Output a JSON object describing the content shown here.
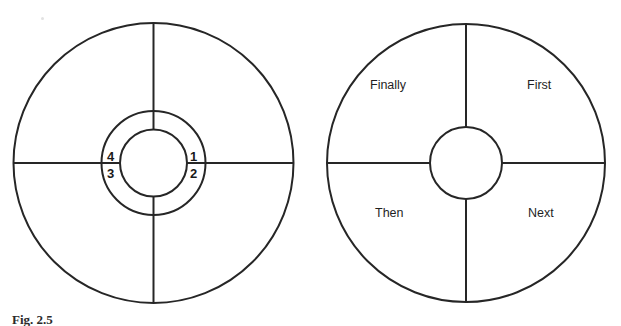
{
  "figure": {
    "caption": "Fig. 2.5",
    "background_color": "#ffffff",
    "stroke_color": "#262626"
  },
  "left_diagram": {
    "name": "numbered-quadrant-wheel",
    "segment_labels": [
      {
        "id": "1",
        "text": "1",
        "quadrant": "upper-right"
      },
      {
        "id": "2",
        "text": "2",
        "quadrant": "lower-right"
      },
      {
        "id": "3",
        "text": "3",
        "quadrant": "lower-left"
      },
      {
        "id": "4",
        "text": "4",
        "quadrant": "upper-left"
      }
    ]
  },
  "right_diagram": {
    "name": "sequence-quadrant-wheel",
    "segment_labels": [
      {
        "id": "first",
        "text": "First",
        "quadrant": "upper-right"
      },
      {
        "id": "next",
        "text": "Next",
        "quadrant": "lower-right"
      },
      {
        "id": "then",
        "text": "Then",
        "quadrant": "lower-left"
      },
      {
        "id": "finally",
        "text": "Finally",
        "quadrant": "upper-left"
      }
    ]
  }
}
